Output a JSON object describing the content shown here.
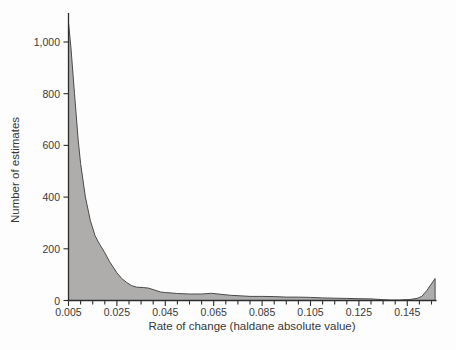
{
  "figure": {
    "background": "#fdfdfd",
    "axis_color": "#2d2d2d",
    "text_color": "#3a3a3a"
  },
  "chart_data": {
    "type": "area",
    "title": "",
    "xlabel": "Rate of change (haldane absolute value)",
    "ylabel": "Number of estimates",
    "xlim": [
      0.005,
      0.157
    ],
    "ylim": [
      0,
      1100
    ],
    "grid": false,
    "legend": "none",
    "fill_color": "#aeadac",
    "line_color": "#4a4a4a",
    "x_minor_tick_step": 0.005,
    "x_major_tick_values": [
      0.005,
      0.025,
      0.045,
      0.065,
      0.085,
      0.105,
      0.125,
      0.145
    ],
    "x_tick_labels": [
      "0.005",
      "0.025",
      "0.045",
      "0.065",
      "0.085",
      "0.105",
      "0.125",
      "0.145"
    ],
    "y_tick_values": [
      0,
      200,
      400,
      600,
      800,
      1000
    ],
    "y_tick_labels": [
      "0",
      "200",
      "400",
      "600",
      "800",
      "1,000"
    ],
    "points": [
      [
        0.005,
        1075
      ],
      [
        0.006,
        980
      ],
      [
        0.0075,
        800
      ],
      [
        0.009,
        620
      ],
      [
        0.01,
        530
      ],
      [
        0.012,
        400
      ],
      [
        0.014,
        310
      ],
      [
        0.016,
        250
      ],
      [
        0.018,
        215
      ],
      [
        0.02,
        185
      ],
      [
        0.022,
        150
      ],
      [
        0.025,
        107
      ],
      [
        0.027,
        85
      ],
      [
        0.029,
        70
      ],
      [
        0.031,
        58
      ],
      [
        0.033,
        52
      ],
      [
        0.036,
        50
      ],
      [
        0.038,
        48
      ],
      [
        0.04,
        42
      ],
      [
        0.043,
        33
      ],
      [
        0.045,
        31
      ],
      [
        0.05,
        27
      ],
      [
        0.055,
        25
      ],
      [
        0.06,
        25
      ],
      [
        0.064,
        28
      ],
      [
        0.068,
        24
      ],
      [
        0.072,
        20
      ],
      [
        0.076,
        18
      ],
      [
        0.08,
        16
      ],
      [
        0.085,
        16
      ],
      [
        0.09,
        15
      ],
      [
        0.095,
        13
      ],
      [
        0.1,
        13
      ],
      [
        0.105,
        12
      ],
      [
        0.11,
        10
      ],
      [
        0.115,
        9
      ],
      [
        0.12,
        8
      ],
      [
        0.125,
        7
      ],
      [
        0.13,
        6
      ],
      [
        0.135,
        3
      ],
      [
        0.138,
        2
      ],
      [
        0.142,
        2
      ],
      [
        0.146,
        4
      ],
      [
        0.149,
        8
      ],
      [
        0.151,
        16
      ],
      [
        0.153,
        38
      ],
      [
        0.1565,
        85
      ]
    ]
  }
}
